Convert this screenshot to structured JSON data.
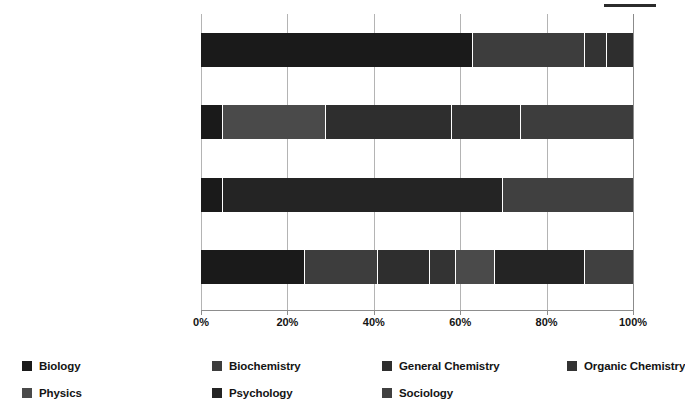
{
  "chart_data": {
    "type": "bar",
    "orientation": "horizontal",
    "stacked": true,
    "stack_normalized_percent": true,
    "title": "",
    "subtitle": "",
    "xlabel": "",
    "ylabel": "",
    "xlim": [
      0,
      100
    ],
    "xticks": [
      0,
      20,
      40,
      60,
      80,
      100
    ],
    "xtick_labels": [
      "0%",
      "20%",
      "40%",
      "60%",
      "80%",
      "100%"
    ],
    "grid": true,
    "grid_axis": "x",
    "legend_position": "bottom",
    "categories": [
      {
        "line1": "Biological and Biochemical",
        "line2": "Foundations of Living Systems"
      },
      {
        "line1": "Chemical and Physical",
        "line2": "Foundations of Biological Systems"
      },
      {
        "line1": "Psychological, Social, and Biological",
        "line2": "Foundations of Behavior"
      },
      {
        "line1": "MCAT",
        "line2": ""
      }
    ],
    "series": [
      {
        "name": "Biology",
        "color": "#1a1a1a",
        "values": [
          63,
          5,
          5,
          24
        ]
      },
      {
        "name": "Biochemistry",
        "color": "#3d3d3d",
        "values": [
          26,
          0,
          0,
          17
        ]
      },
      {
        "name": "General Chemistry",
        "color": "#2e2e2e",
        "values": [
          0,
          24,
          0,
          12
        ]
      },
      {
        "name": "Organic Chemistry",
        "color": "#333333",
        "values": [
          5,
          0,
          0,
          6
        ]
      },
      {
        "name": "Physics",
        "color": "#4a4a4a",
        "values": [
          6,
          29,
          0,
          9
        ]
      },
      {
        "name": "Psychology",
        "color": "#242424",
        "values": [
          0,
          16,
          65,
          21
        ]
      },
      {
        "name": "Sociology",
        "color": "#404040",
        "values": [
          0,
          26,
          30,
          11
        ]
      }
    ],
    "bars": [
      {
        "category": "Biological and Biochemical",
        "segments": [
          {
            "series": "Biology",
            "value": 63,
            "start": 0,
            "end": 63,
            "color": "#1a1a1a"
          },
          {
            "series": "Biochemistry",
            "value": 26,
            "start": 63,
            "end": 89,
            "color": "#3d3d3d"
          },
          {
            "series": "Organic Chemistry",
            "value": 5,
            "start": 89,
            "end": 94,
            "color": "#333333"
          },
          {
            "series": "General Chemistry",
            "value": 6,
            "start": 94,
            "end": 100,
            "color": "#2e2e2e"
          }
        ]
      },
      {
        "category": "Chemical and Physical",
        "segments": [
          {
            "series": "Biology",
            "value": 5,
            "start": 0,
            "end": 5,
            "color": "#1a1a1a"
          },
          {
            "series": "Physics",
            "value": 24,
            "start": 5,
            "end": 29,
            "color": "#4a4a4a"
          },
          {
            "series": "General Chemistry",
            "value": 29,
            "start": 29,
            "end": 58,
            "color": "#2e2e2e"
          },
          {
            "series": "Organic Chemistry",
            "value": 16,
            "start": 58,
            "end": 74,
            "color": "#333333"
          },
          {
            "series": "Biochemistry",
            "value": 26,
            "start": 74,
            "end": 100,
            "color": "#3d3d3d"
          }
        ]
      },
      {
        "category": "Psychological, Social, and Biological",
        "segments": [
          {
            "series": "Biology",
            "value": 5,
            "start": 0,
            "end": 5,
            "color": "#1a1a1a"
          },
          {
            "series": "Psychology",
            "value": 65,
            "start": 5,
            "end": 70,
            "color": "#242424"
          },
          {
            "series": "Sociology",
            "value": 30,
            "start": 70,
            "end": 100,
            "color": "#404040"
          }
        ]
      },
      {
        "category": "MCAT",
        "segments": [
          {
            "series": "Biology",
            "value": 24,
            "start": 0,
            "end": 24,
            "color": "#1a1a1a"
          },
          {
            "series": "Biochemistry",
            "value": 17,
            "start": 24,
            "end": 41,
            "color": "#3d3d3d"
          },
          {
            "series": "General Chemistry",
            "value": 12,
            "start": 41,
            "end": 53,
            "color": "#2e2e2e"
          },
          {
            "series": "Organic Chemistry",
            "value": 6,
            "start": 53,
            "end": 59,
            "color": "#333333"
          },
          {
            "series": "Physics",
            "value": 9,
            "start": 59,
            "end": 68,
            "color": "#4a4a4a"
          },
          {
            "series": "Psychology",
            "value": 21,
            "start": 68,
            "end": 89,
            "color": "#242424"
          },
          {
            "series": "Sociology",
            "value": 11,
            "start": 89,
            "end": 100,
            "color": "#404040"
          }
        ]
      }
    ],
    "legend": [
      {
        "label": "Biology",
        "color": "#1a1a1a"
      },
      {
        "label": "Biochemistry",
        "color": "#3d3d3d"
      },
      {
        "label": "General Chemistry",
        "color": "#2e2e2e"
      },
      {
        "label": "Organic Chemistry",
        "color": "#333333"
      },
      {
        "label": "Physics",
        "color": "#4a4a4a"
      },
      {
        "label": "Psychology",
        "color": "#242424"
      },
      {
        "label": "Sociology",
        "color": "#404040"
      }
    ]
  }
}
